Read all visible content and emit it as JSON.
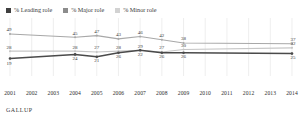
{
  "header": {
    "cropped_top_text": ""
  },
  "legend": {
    "position": "top-left",
    "items": [
      {
        "label": "% Leading role",
        "color": "#3f3f3f",
        "name": "leading-role"
      },
      {
        "label": "% Major role",
        "color": "#8c8c8c",
        "name": "major-role"
      },
      {
        "label": "% Minor role",
        "color": "#cfcfcf",
        "name": "minor-role"
      }
    ]
  },
  "source": {
    "label": "GALLUP"
  },
  "chart_data": {
    "type": "line",
    "title": "",
    "subtitle": "",
    "xlabel": "",
    "ylabel": "",
    "grid": true,
    "grid_orientation": "vertical",
    "legend_position": "top-left",
    "ylim": [
      0,
      60
    ],
    "categories": [
      "2001",
      "2002",
      "2003",
      "2004",
      "2005",
      "2006",
      "2007",
      "2008",
      "2009",
      "2010",
      "2011",
      "2012",
      "2013",
      "2014"
    ],
    "series": [
      {
        "name": "% Minor role",
        "color": "#a8a8a8",
        "values": [
          49,
          null,
          null,
          45,
          47,
          43,
          46,
          42,
          38,
          null,
          null,
          null,
          null,
          37
        ],
        "labels": [
          "49",
          "",
          "",
          "45",
          "47",
          "43",
          "46",
          "42",
          "38",
          "",
          "",
          "",
          "",
          "37"
        ]
      },
      {
        "name": "% Major role",
        "color": "#c6c6c6",
        "values": [
          28,
          null,
          null,
          28,
          27,
          28,
          29,
          27,
          30,
          null,
          null,
          null,
          null,
          32
        ],
        "labels": [
          "28",
          "",
          "",
          "28",
          "27",
          "28",
          "29",
          "27",
          "30",
          "",
          "",
          "",
          "",
          "32"
        ]
      },
      {
        "name": "% Leading role",
        "color": "#4a4a4a",
        "values": [
          19,
          null,
          null,
          24,
          21,
          26,
          29,
          26,
          26,
          null,
          null,
          null,
          null,
          25
        ],
        "labels": [
          "19",
          "",
          "",
          "24",
          "21",
          "26",
          "22",
          "26",
          "26",
          "",
          "",
          "",
          "",
          "25"
        ]
      }
    ]
  }
}
